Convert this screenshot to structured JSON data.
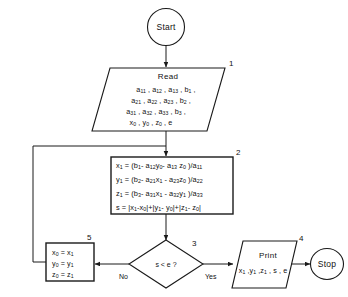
{
  "diagram": {
    "type": "flowchart",
    "stroke_color": "#1a1a1a",
    "background_color": "#ffffff"
  },
  "nodes": {
    "start": {
      "label": "Start",
      "shape": "terminator-circle",
      "step": ""
    },
    "read": {
      "shape": "parallelogram-io",
      "step": "1",
      "header": "Read",
      "lines": [
        "a11 , a12 , a13 , b1 ,",
        "a21 , a22 , a23 , b2 ,",
        "a31 , a32 , a33 , b3 ,",
        "x0 , y0 , z0 , e"
      ]
    },
    "compute": {
      "shape": "process-rectangle",
      "step": "2",
      "lines": [
        "x1 = (b1 - a12 y0 - a13 z0 )/a11",
        "y1 = (b2 - a21 x1 - a23 z0 )/a22",
        "z1 = (b3 - a31 x1 - a32 y1 )/a33",
        "s = |x1-x0|+|y1- y0|+|z1- z0|"
      ]
    },
    "decision": {
      "shape": "diamond",
      "step": "3",
      "condition": "s < e ?",
      "no_label": "No",
      "yes_label": "Yes"
    },
    "print": {
      "shape": "parallelogram-io",
      "step": "4",
      "header": "Print",
      "lines": [
        "x1 , y1 , z1 , s , e"
      ]
    },
    "stop": {
      "label": "Stop",
      "shape": "terminator-circle",
      "step": ""
    },
    "update": {
      "shape": "process-rectangle",
      "step": "5",
      "lines": [
        "x0 = x1",
        "y0 = y1",
        "z0 = z1"
      ]
    }
  }
}
